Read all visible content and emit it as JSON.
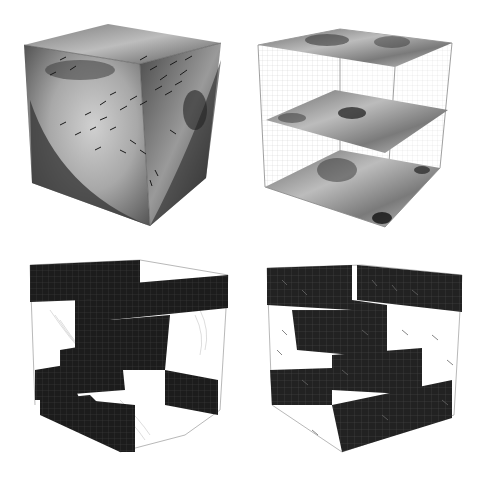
{
  "figure": {
    "layout": "2x2 grid of 3D cube visualizations",
    "background": "#ffffff",
    "panels": [
      {
        "id": "p1",
        "position": "top-left",
        "content": "Shaded cube surfaces with dense vector (arrow) field overlay and curved shading boundary"
      },
      {
        "id": "p2",
        "position": "top-right",
        "content": "Wireframe grid cube with three horizontal shaded slices (top, middle, bottom)"
      },
      {
        "id": "p3",
        "position": "bottom-left",
        "content": "Dark gridded block obstacle structure inside wireframe cube with faint streamlines"
      },
      {
        "id": "p4",
        "position": "bottom-right",
        "content": "Dark gridded block obstacle structure inside wireframe cube with scattered vector arrows"
      }
    ],
    "colors": {
      "block_fill": "#1c1c1c",
      "block_grid": "#3a3a3a",
      "wire": "#888888",
      "slice_light": "#c8c8c8",
      "slice_dark": "#3a3a3a",
      "arrow": "#1a1a1a"
    }
  }
}
